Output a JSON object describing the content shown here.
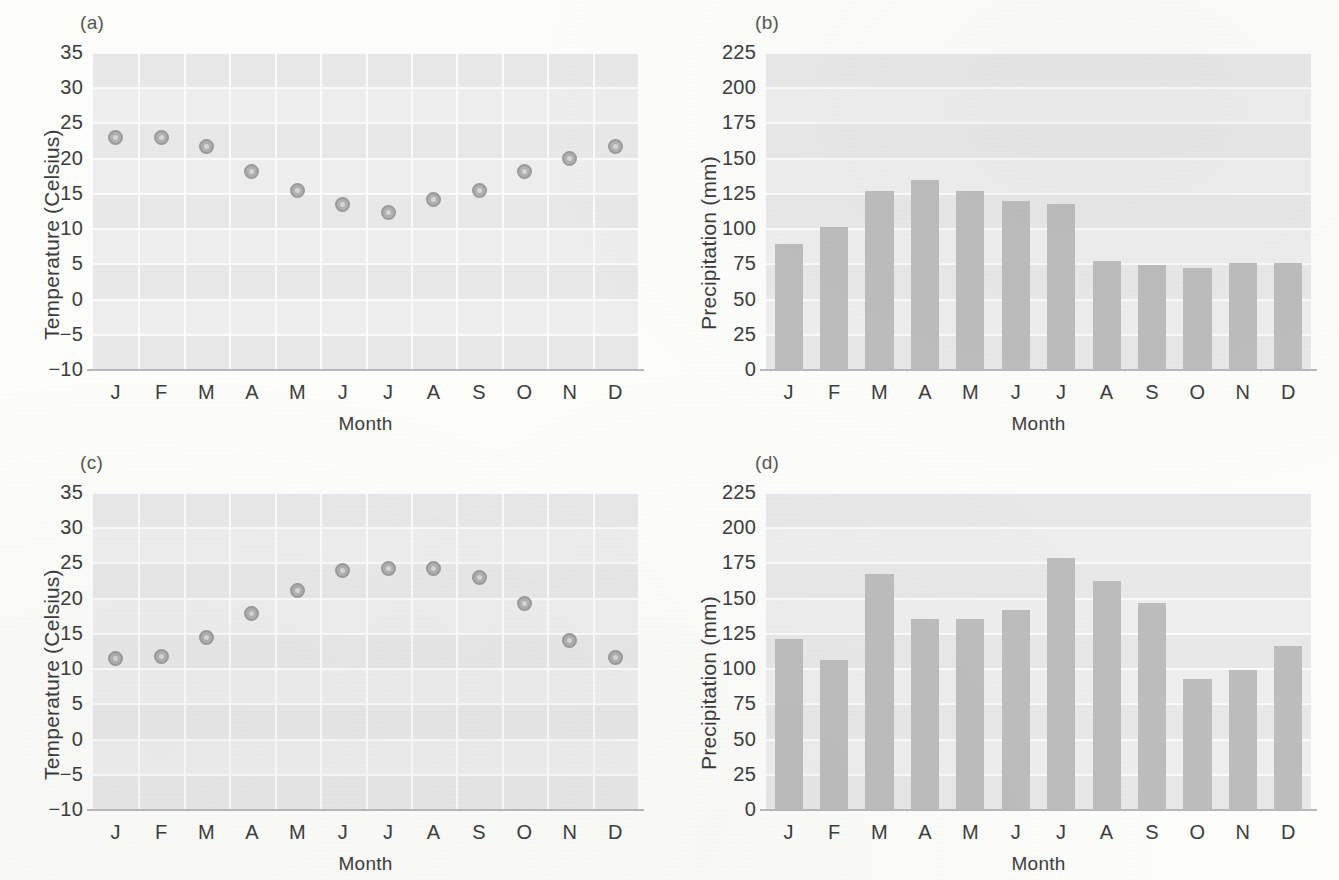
{
  "figure": {
    "panels": [
      {
        "tag": "(a)"
      },
      {
        "tag": "(b)"
      },
      {
        "tag": "(c)"
      },
      {
        "tag": "(d)"
      }
    ]
  },
  "chart_data": [
    {
      "panel": "(a)",
      "type": "scatter",
      "title": "",
      "xlabel": "Month",
      "ylabel": "Temperature (Celsius)",
      "categories": [
        "J",
        "F",
        "M",
        "A",
        "M",
        "J",
        "J",
        "A",
        "S",
        "O",
        "N",
        "D"
      ],
      "values": [
        22.8,
        22.9,
        21.6,
        18.1,
        15.4,
        13.3,
        12.2,
        14.0,
        15.3,
        18.1,
        19.9,
        21.6
      ],
      "ylim": [
        -10,
        35
      ],
      "ytick_labels": [
        "35",
        "30",
        "25",
        "20",
        "15",
        "10",
        "5",
        "0",
        "-5",
        "-10"
      ],
      "ytick_values": [
        35,
        30,
        25,
        20,
        15,
        10,
        5,
        0,
        -5,
        -10
      ],
      "grid": true,
      "legend": "none",
      "marker_color": "#b0b0b0"
    },
    {
      "panel": "(b)",
      "type": "bar",
      "title": "",
      "xlabel": "Month",
      "ylabel": "Precipitation (mm)",
      "categories": [
        "J",
        "F",
        "M",
        "A",
        "M",
        "J",
        "J",
        "A",
        "S",
        "O",
        "N",
        "D"
      ],
      "values": [
        89,
        101,
        126,
        134,
        126,
        119,
        117,
        77,
        74,
        72,
        75,
        75
      ],
      "ylim": [
        0,
        225
      ],
      "ytick_labels": [
        "225",
        "200",
        "175",
        "150",
        "125",
        "100",
        "75",
        "50",
        "25",
        "0"
      ],
      "ytick_values": [
        225,
        200,
        175,
        150,
        125,
        100,
        75,
        50,
        25,
        0
      ],
      "grid": true,
      "legend": "none",
      "bar_color": "#bdbdbd"
    },
    {
      "panel": "(c)",
      "type": "scatter",
      "title": "",
      "xlabel": "Month",
      "ylabel": "Temperature (Celsius)",
      "categories": [
        "J",
        "F",
        "M",
        "A",
        "M",
        "J",
        "J",
        "A",
        "S",
        "O",
        "N",
        "D"
      ],
      "values": [
        11.3,
        11.6,
        14.4,
        17.7,
        21.0,
        23.8,
        24.1,
        24.1,
        22.8,
        19.2,
        13.9,
        11.5
      ],
      "ylim": [
        -10,
        35
      ],
      "ytick_labels": [
        "35",
        "30",
        "25",
        "20",
        "15",
        "10",
        "5",
        "0",
        "-5",
        "-10"
      ],
      "ytick_values": [
        35,
        30,
        25,
        20,
        15,
        10,
        5,
        0,
        -5,
        -10
      ],
      "grid": true,
      "legend": "none",
      "marker_color": "#b0b0b0"
    },
    {
      "panel": "(d)",
      "type": "bar",
      "title": "",
      "xlabel": "Month",
      "ylabel": "Precipitation (mm)",
      "categories": [
        "J",
        "F",
        "M",
        "A",
        "M",
        "J",
        "J",
        "A",
        "S",
        "O",
        "N",
        "D"
      ],
      "values": [
        121,
        106,
        167,
        135,
        135,
        141,
        178,
        162,
        146,
        92,
        99,
        116
      ],
      "ylim": [
        0,
        225
      ],
      "ytick_labels": [
        "225",
        "200",
        "175",
        "150",
        "125",
        "100",
        "75",
        "50",
        "25",
        "0"
      ],
      "ytick_values": [
        225,
        200,
        175,
        150,
        125,
        100,
        75,
        50,
        25,
        0
      ],
      "grid": true,
      "legend": "none",
      "bar_color": "#bdbdbd"
    }
  ]
}
